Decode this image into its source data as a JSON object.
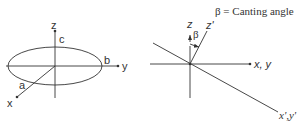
{
  "diagram": {
    "left_panel": {
      "description": "Spheroid with semi-axes a, b, c in x, y, z frame",
      "axis_labels": {
        "z": "z",
        "y": "y",
        "x": "x"
      },
      "semi_axis_labels": {
        "a": "a",
        "b": "b",
        "c": "c"
      }
    },
    "right_panel": {
      "description": "Canted frame rotated by beta",
      "axis_labels": {
        "z": "z",
        "z_prime": "z'",
        "xy": "x, y",
        "xy_prime": "x',y'"
      },
      "angle_label": "β",
      "legend": "β = Canting angle"
    },
    "colors": {
      "stroke": "#333333",
      "background": "#ffffff"
    }
  }
}
